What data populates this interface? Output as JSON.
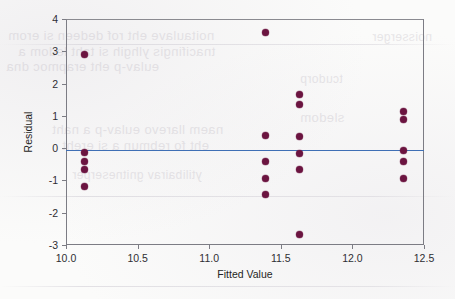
{
  "figure": {
    "kind": "residual-plot",
    "point_color": "#6b1440",
    "reference_line_color": "#3f6fb5",
    "frame_color": "#7c7c84"
  },
  "scan_artifacts": {
    "note": "faint mirrored bleed-through text from reverse side of scanned page",
    "ghost_lines": [
      {
        "text": "noitaulave eht rof dedeen si erom",
        "x": 8,
        "y": 28,
        "size": 13
      },
      {
        "text": "tnacifingis ylhgih si taht ledom a",
        "x": 18,
        "y": 44,
        "size": 13
      },
      {
        "text": "eulav-p eht erapmoc dna",
        "x": 6,
        "y": 59,
        "size": 13
      },
      {
        "text": "naem llarevo eulav-p a naht",
        "x": 52,
        "y": 122,
        "size": 13
      },
      {
        "text": "eht fo rebmun a si ereht",
        "x": 62,
        "y": 138,
        "size": 13
      },
      {
        "text": "ytilibairav gnitneserper",
        "x": 72,
        "y": 168,
        "size": 12
      },
      {
        "text": "sledom",
        "x": 300,
        "y": 110,
        "size": 13
      },
      {
        "text": "tcudorp",
        "x": 300,
        "y": 72,
        "size": 12
      },
      {
        "text": "noisserger",
        "x": 372,
        "y": 30,
        "size": 12
      }
    ],
    "streaks": [
      {
        "x": 0,
        "y": 44,
        "width": 455
      },
      {
        "x": 0,
        "y": 196,
        "width": 455
      },
      {
        "x": 0,
        "y": 286,
        "width": 455
      }
    ]
  },
  "chart_data": {
    "type": "scatter",
    "title": "",
    "subtitle": "",
    "xlabel": "Fitted Value",
    "ylabel": "Residual",
    "xlim": [
      10.0,
      12.5
    ],
    "ylim": [
      -3,
      4
    ],
    "xticks": [
      10.0,
      10.5,
      11.0,
      11.5,
      12.0,
      12.5
    ],
    "xticklabels": [
      "10.0",
      "10.5",
      "11.0",
      "11.5",
      "12.0",
      "12.5"
    ],
    "yticks": [
      -3,
      -2,
      -1,
      0,
      1,
      2,
      3,
      4
    ],
    "yticklabels": [
      "-3",
      "-2",
      "-1",
      "0",
      "1",
      "2",
      "3",
      "4"
    ],
    "grid": false,
    "legend": null,
    "reference_line": {
      "orientation": "horizontal",
      "y": -0.05
    },
    "marker": {
      "shape": "circle",
      "filled": true,
      "size": 7,
      "color": "#6b1440"
    },
    "points": [
      {
        "x": 10.13,
        "y": 2.89
      },
      {
        "x": 10.13,
        "y": -0.13
      },
      {
        "x": 10.13,
        "y": -0.41
      },
      {
        "x": 10.13,
        "y": -0.66
      },
      {
        "x": 10.13,
        "y": -1.18
      },
      {
        "x": 11.39,
        "y": 3.59
      },
      {
        "x": 11.39,
        "y": 0.4
      },
      {
        "x": 11.39,
        "y": -0.42
      },
      {
        "x": 11.39,
        "y": -0.95
      },
      {
        "x": 11.39,
        "y": -1.43
      },
      {
        "x": 11.63,
        "y": 1.66
      },
      {
        "x": 11.63,
        "y": 1.36
      },
      {
        "x": 11.63,
        "y": 0.35
      },
      {
        "x": 11.63,
        "y": -0.16
      },
      {
        "x": 11.63,
        "y": -0.67
      },
      {
        "x": 11.63,
        "y": -2.69
      },
      {
        "x": 12.36,
        "y": 1.13
      },
      {
        "x": 12.36,
        "y": 0.89
      },
      {
        "x": 12.36,
        "y": -0.06
      },
      {
        "x": 12.36,
        "y": -0.42
      },
      {
        "x": 12.36,
        "y": -0.94
      }
    ]
  }
}
